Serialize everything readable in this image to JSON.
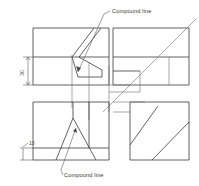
{
  "drawing": {
    "title": "Orthographic projection with compound lines",
    "background_color": "#ffffff",
    "line_color": "#3a3a3a",
    "thin_line_color": "#6d6d6d",
    "annotation_color": "#4a4a4a"
  },
  "annotations": {
    "label_top": "Compound line",
    "label_bottom": "Compound line"
  },
  "dimensions": {
    "vertical_upper": "30",
    "vertical_lower": "10"
  },
  "views": {
    "top_left": {
      "name": "front-view"
    },
    "top_right": {
      "name": "side-view"
    },
    "bottom_left": {
      "name": "top-view"
    },
    "bottom_right": {
      "name": "auxiliary-view"
    }
  }
}
